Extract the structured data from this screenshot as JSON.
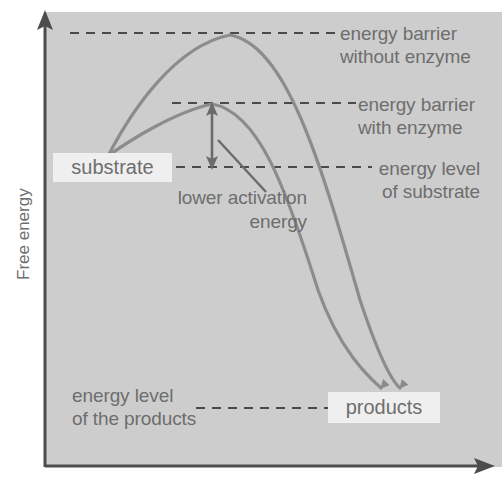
{
  "figure": {
    "type": "energy-profile-diagram",
    "background_color": "#cdcdcd",
    "curve_color": "#8c8c8c",
    "text_color": "#6e6e6e",
    "label_box_color": "#efefef"
  },
  "axes": {
    "y_title": "Free energy",
    "x_title": ""
  },
  "labels": {
    "substrate": "substrate",
    "products": "products",
    "energy_barrier_without_enzyme_l1": "energy barrier",
    "energy_barrier_without_enzyme_l2": "without enzyme",
    "energy_barrier_with_enzyme_l1": "energy barrier",
    "energy_barrier_with_enzyme_l2": "with enzyme",
    "energy_level_of_substrate_l1": "energy level",
    "energy_level_of_substrate_l2": "of substrate",
    "energy_level_of_products_l1": "energy level",
    "energy_level_of_products_l2": "of the products",
    "lower_activation_energy_l1": "lower activation",
    "lower_activation_energy_l2": "energy"
  },
  "chart_data": {
    "type": "line",
    "title": "",
    "xlabel": "",
    "ylabel": "Free energy",
    "grid": false,
    "legend": "none",
    "annotations": [
      "energy barrier without enzyme",
      "energy barrier with enzyme",
      "energy level of substrate",
      "energy level of the products",
      "lower activation energy",
      "substrate",
      "products"
    ],
    "levels": [
      {
        "name": "energy barrier without enzyme",
        "y_px": 33
      },
      {
        "name": "energy barrier with enzyme",
        "y_px": 103
      },
      {
        "name": "energy level of substrate",
        "y_px": 167
      },
      {
        "name": "energy level of the products",
        "y_px": 408
      }
    ],
    "series": [
      {
        "name": "without enzyme",
        "path": "M108,156 C132,110 175,46 230,35 C286,45 320,160 360,300 C380,360 393,382 400,388"
      },
      {
        "name": "with enzyme",
        "path": "M108,156 C130,140 175,112 212,104 C258,112 285,185 318,290 C340,352 370,378 381,388"
      }
    ]
  }
}
